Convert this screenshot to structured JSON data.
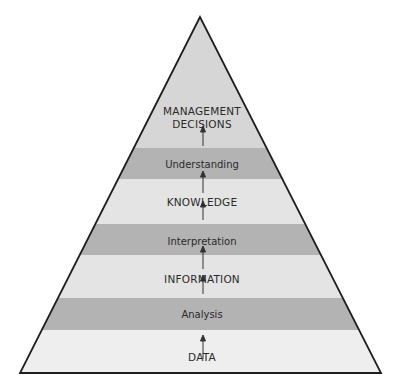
{
  "diagram": {
    "type": "pyramid",
    "direction": "bottom-to-top",
    "colors": {
      "outline": "#1e1e1e",
      "apex_region": "#d6d6d6",
      "level_band": "#e4e4e4",
      "process_band": "#b3b3b3",
      "base_band": "#eeeeee",
      "arrow": "#333333",
      "text": "#2a2a2a"
    },
    "levels": [
      {
        "id": "data",
        "label": "DATA",
        "kind": "level"
      },
      {
        "id": "analysis",
        "label": "Analysis",
        "kind": "process"
      },
      {
        "id": "information",
        "label": "INFORMATION",
        "kind": "level"
      },
      {
        "id": "interpretation",
        "label": "Interpretation",
        "kind": "process"
      },
      {
        "id": "knowledge",
        "label": "KNOWLEDGE",
        "kind": "level"
      },
      {
        "id": "understanding",
        "label": "Understanding",
        "kind": "process"
      },
      {
        "id": "management-decisions",
        "label_line1": "MANAGEMENT",
        "label_line2": "DECISIONS",
        "kind": "level"
      }
    ]
  }
}
